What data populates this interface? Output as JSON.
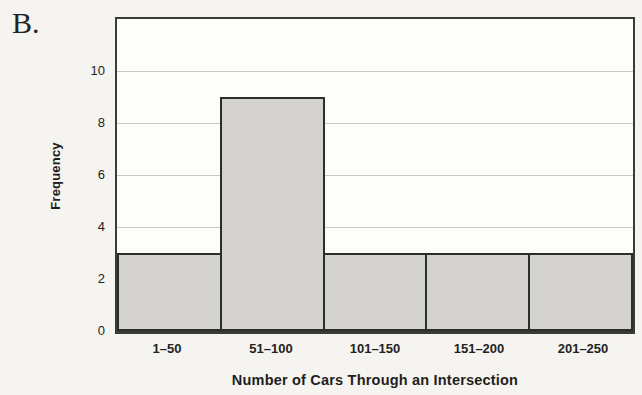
{
  "panel_label": "B.",
  "chart_data": {
    "type": "bar",
    "subtype": "histogram",
    "title": "",
    "categories": [
      "1–50",
      "51–100",
      "101–150",
      "151–200",
      "201–250"
    ],
    "values": [
      3,
      9,
      3,
      3,
      3
    ],
    "xlabel": "Number of Cars Through an Intersection",
    "ylabel": "Frequency",
    "ylim": [
      0,
      12
    ],
    "yticks": [
      0,
      2,
      4,
      6,
      8,
      10
    ],
    "grid": true,
    "legend_position": "none",
    "colors": {
      "bar_fill": "#d4d2cf",
      "bar_border": "#2d2d2b",
      "gridline": "#c8c8c6",
      "plot_background": "#fdfdfc",
      "page_background": "#f6f4f1",
      "frame": "#3a3a38"
    }
  }
}
